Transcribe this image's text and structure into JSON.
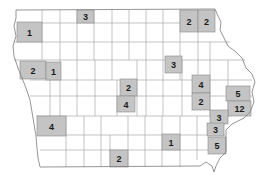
{
  "map": {
    "region": "Iowa counties",
    "shade_color": "#c4c4c4",
    "border_color": "#9a9a9a",
    "shaded_counties": [
      {
        "id": "c1",
        "value": "3",
        "x": 77,
        "y": 10,
        "w": 17,
        "h": 13
      },
      {
        "id": "c2",
        "value": "1",
        "x": 17,
        "y": 22,
        "w": 25,
        "h": 20
      },
      {
        "id": "c3",
        "value": "2",
        "x": 180,
        "y": 10,
        "w": 18,
        "h": 22
      },
      {
        "id": "c4",
        "value": "2",
        "x": 198,
        "y": 10,
        "w": 17,
        "h": 22
      },
      {
        "id": "c5",
        "value": "2",
        "x": 20,
        "y": 61,
        "w": 26,
        "h": 18
      },
      {
        "id": "c6",
        "value": "1",
        "x": 46,
        "y": 62,
        "w": 15,
        "h": 18
      },
      {
        "id": "c7",
        "value": "3",
        "x": 165,
        "y": 56,
        "w": 17,
        "h": 17
      },
      {
        "id": "c8",
        "value": "2",
        "x": 120,
        "y": 79,
        "w": 17,
        "h": 17
      },
      {
        "id": "c9",
        "value": "4",
        "x": 117,
        "y": 96,
        "w": 18,
        "h": 16
      },
      {
        "id": "c10",
        "value": "4",
        "x": 192,
        "y": 75,
        "w": 18,
        "h": 18
      },
      {
        "id": "c11",
        "value": "2",
        "x": 192,
        "y": 93,
        "w": 18,
        "h": 17
      },
      {
        "id": "c12",
        "value": "5",
        "x": 226,
        "y": 86,
        "w": 24,
        "h": 15
      },
      {
        "id": "c13",
        "value": "12",
        "x": 228,
        "y": 101,
        "w": 23,
        "h": 15
      },
      {
        "id": "c14",
        "value": "3",
        "x": 210,
        "y": 110,
        "w": 18,
        "h": 14
      },
      {
        "id": "c15",
        "value": "3",
        "x": 207,
        "y": 123,
        "w": 17,
        "h": 13
      },
      {
        "id": "c16",
        "value": "5",
        "x": 208,
        "y": 137,
        "w": 18,
        "h": 17
      },
      {
        "id": "c17",
        "value": "4",
        "x": 37,
        "y": 116,
        "w": 29,
        "h": 20
      },
      {
        "id": "c18",
        "value": "1",
        "x": 162,
        "y": 134,
        "w": 18,
        "h": 16
      },
      {
        "id": "c19",
        "value": "2",
        "x": 110,
        "y": 150,
        "w": 18,
        "h": 17
      }
    ]
  }
}
